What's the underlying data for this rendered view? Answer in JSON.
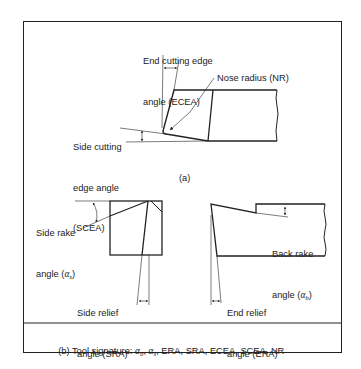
{
  "figure": {
    "part_a": {
      "caption": "(a)",
      "labels": {
        "ecea_line1": "End cutting edge",
        "ecea_line2": "angle (ECEA)",
        "nose_radius": "Nose radius (NR)",
        "scea_line1": "Side cutting",
        "scea_line2": "edge angle",
        "scea_line3": "(SCEA)"
      }
    },
    "part_b": {
      "labels": {
        "side_rake_line1": "Side rake",
        "side_rake_line2_prefix": "angle (",
        "side_rake_symbol": "α",
        "side_rake_sub": "s",
        "side_rake_suffix": ")",
        "back_rake_line1": "Back rake",
        "back_rake_line2_prefix": "angle (",
        "back_rake_symbol": "α",
        "back_rake_sub": "b",
        "back_rake_suffix": ")",
        "side_relief_line1": "Side relief",
        "side_relief_line2": "angle (SRA)",
        "end_relief_line1": "End relief",
        "end_relief_line2": "angle (ERA)"
      }
    },
    "signature": {
      "prefix": "(b) Tool signature: ",
      "alpha": "α",
      "sub_b": "b",
      "sub_s": "s",
      "sep": ", ",
      "rest": ", ERA, SRA, ECEA, SCEA, NR"
    }
  }
}
